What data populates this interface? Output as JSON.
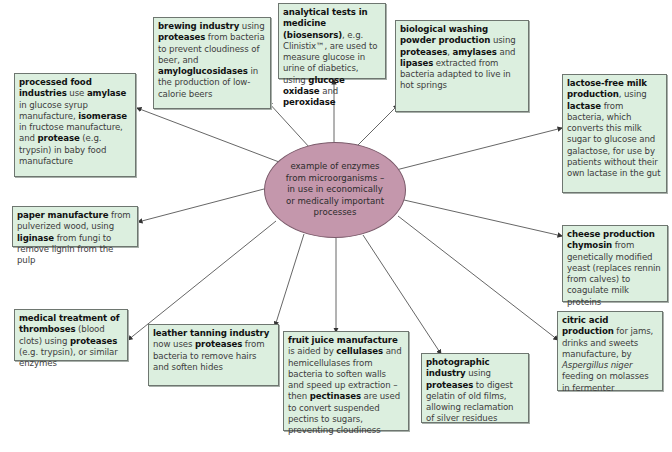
{
  "center": {
    "lines": [
      "example of enzymes",
      "from microorganisms –",
      "in use in economically",
      "or medically important",
      "processes"
    ],
    "fill_color": "#c497ac"
  },
  "box_color": "#dcefdf",
  "boxes": {
    "processed_food": {
      "title": "processed food industries",
      "parts": [
        {
          "t": "processed food industries",
          "b": true
        },
        {
          "t": " use ",
          "b": false
        },
        {
          "t": "amylase",
          "b": true
        },
        {
          "t": " in glucose syrup manufacture, ",
          "b": false
        },
        {
          "t": "isomerase",
          "b": true
        },
        {
          "t": " in fructose manufacture, and ",
          "b": false
        },
        {
          "t": "protease",
          "b": true
        },
        {
          "t": " (e.g. trypsin) in baby food manufacture",
          "b": false
        }
      ]
    },
    "brewing": {
      "title": "brewing industry",
      "parts": [
        {
          "t": "brewing industry",
          "b": true
        },
        {
          "t": " using ",
          "b": false
        },
        {
          "t": "proteases",
          "b": true
        },
        {
          "t": " from bacteria to prevent cloudiness of beer, and ",
          "b": false
        },
        {
          "t": "amyloglucosidases",
          "b": true
        },
        {
          "t": " in the production of low-calorie beers",
          "b": false
        }
      ]
    },
    "analytical": {
      "title": "analytical tests in medicine (biosensors)",
      "parts": [
        {
          "t": "analytical tests in medicine (biosensors)",
          "b": true
        },
        {
          "t": ", e.g. Clinistix™, are used to measure glucose in urine of diabetics, using ",
          "b": false
        },
        {
          "t": "glucose oxidase",
          "b": true
        },
        {
          "t": " and ",
          "b": false
        },
        {
          "t": "peroxidase",
          "b": true
        }
      ]
    },
    "washing": {
      "title": "biological washing powder production",
      "parts": [
        {
          "t": "biological washing powder production",
          "b": true
        },
        {
          "t": " using ",
          "b": false
        },
        {
          "t": "proteases",
          "b": true
        },
        {
          "t": ", ",
          "b": false
        },
        {
          "t": "amylases",
          "b": true
        },
        {
          "t": " and ",
          "b": false
        },
        {
          "t": "lipases",
          "b": true
        },
        {
          "t": " extracted from bacteria adapted to live in hot springs",
          "b": false
        }
      ]
    },
    "lactose": {
      "title": "lactose-free milk production",
      "parts": [
        {
          "t": "lactose-free milk production",
          "b": true
        },
        {
          "t": ", using ",
          "b": false
        },
        {
          "t": "lactase",
          "b": true
        },
        {
          "t": " from bacteria, which converts this milk sugar to glucose and galactose, for use by patients without their own lactase in the gut",
          "b": false
        }
      ]
    },
    "paper": {
      "title": "paper manufacture",
      "parts": [
        {
          "t": "paper manufacture",
          "b": true
        },
        {
          "t": " from pulverized wood, using ",
          "b": false
        },
        {
          "t": "liginase",
          "b": true
        },
        {
          "t": " from fungi to remove lignin from the pulp",
          "b": false
        }
      ]
    },
    "cheese": {
      "title": "cheese production",
      "parts": [
        {
          "t": "cheese production chymosin",
          "b": true
        },
        {
          "t": " from genetically modified yeast (replaces rennin from calves) to coagulate milk proteins",
          "b": false
        }
      ]
    },
    "medical": {
      "title": "medical treatment of thromboses",
      "parts": [
        {
          "t": "medical treatment of thromboses",
          "b": true
        },
        {
          "t": " (blood clots) using ",
          "b": false
        },
        {
          "t": "proteases",
          "b": true
        },
        {
          "t": " (e.g. trypsin), or similar enzymes",
          "b": false
        }
      ]
    },
    "leather": {
      "title": "leather tanning industry",
      "parts": [
        {
          "t": "leather tanning industry",
          "b": true
        },
        {
          "t": " now uses ",
          "b": false
        },
        {
          "t": "proteases",
          "b": true
        },
        {
          "t": " from bacteria to remove hairs and soften hides",
          "b": false
        }
      ]
    },
    "fruit_juice": {
      "title": "fruit juice manufacture",
      "parts": [
        {
          "t": "fruit juice manufacture",
          "b": true
        },
        {
          "t": " is aided by ",
          "b": false
        },
        {
          "t": "cellulases",
          "b": true
        },
        {
          "t": " and hemicellulases from bacteria to soften walls and speed up extraction – then ",
          "b": false
        },
        {
          "t": "pectinases",
          "b": true
        },
        {
          "t": " are used to convert suspended pectins to sugars, preventing cloudiness",
          "b": false
        }
      ]
    },
    "photographic": {
      "title": "photographic industry",
      "parts": [
        {
          "t": "photographic industry",
          "b": true
        },
        {
          "t": " using ",
          "b": false
        },
        {
          "t": "proteases",
          "b": true
        },
        {
          "t": " to digest gelatin of old films, allowing reclamation of silver residues",
          "b": false
        }
      ]
    },
    "citric": {
      "title": "citric acid production",
      "parts": [
        {
          "t": "citric acid production",
          "b": true
        },
        {
          "t": " for jams, drinks and sweets manufacture, by ",
          "b": false
        },
        {
          "t": "Aspergillus niger",
          "b": false,
          "i": true
        },
        {
          "t": " feeding on molasses in fermenter",
          "b": false
        }
      ]
    }
  }
}
